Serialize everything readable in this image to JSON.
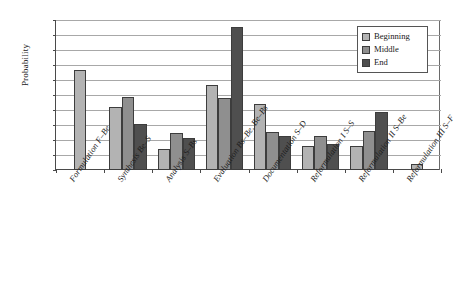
{
  "chart_data": {
    "type": "bar",
    "title": "",
    "xlabel": "",
    "ylabel": "Probability",
    "ylim": [
      0,
      1.0
    ],
    "ytick_labels": [
      "1.0",
      "0.9",
      "0.8",
      "0.7",
      "0.6",
      "0.5",
      "0.4",
      "0.3",
      "0.2",
      "0.1",
      "0"
    ],
    "ytick_values": [
      1.0,
      0.9,
      0.8,
      0.7,
      0.6,
      0.5,
      0.4,
      0.3,
      0.2,
      0.1,
      0
    ],
    "grid": true,
    "legend_position": "top-right",
    "categories": [
      "Formulation F–Be",
      "Synthesis Be–S",
      "Analysis S–Bs",
      "Evaluation Bs–Be, Be–Bs",
      "Documentation S–D",
      "Reformulation I S–S",
      "Reformulation II S–Be",
      "Reformulation III S–F"
    ],
    "series": [
      {
        "name": "Beginning",
        "color": "#b3b3b3",
        "values": [
          0.665,
          0.42,
          0.14,
          0.565,
          0.44,
          0.16,
          0.16,
          0.04
        ]
      },
      {
        "name": "Middle",
        "color": "#8f8f8f",
        "values": [
          null,
          0.485,
          0.245,
          0.48,
          0.255,
          0.23,
          0.26,
          null
        ]
      },
      {
        "name": "End",
        "color": "#4f4f4f",
        "values": [
          null,
          0.31,
          0.215,
          0.955,
          0.23,
          0.175,
          0.39,
          null
        ]
      }
    ]
  },
  "legend": {
    "items": [
      {
        "label": "Beginning",
        "color": "#b3b3b3"
      },
      {
        "label": "Middle",
        "color": "#8f8f8f"
      },
      {
        "label": "End",
        "color": "#4f4f4f"
      }
    ]
  }
}
